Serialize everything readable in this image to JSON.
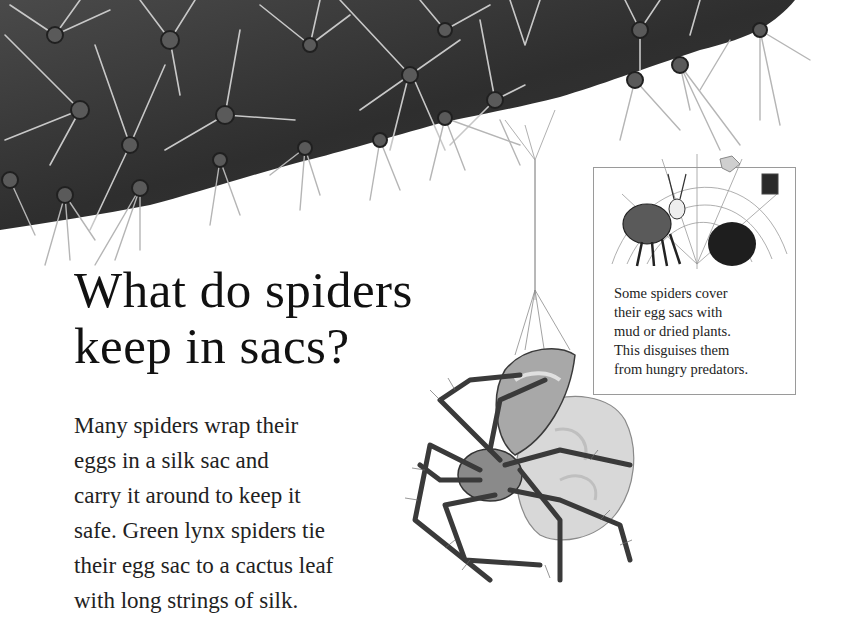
{
  "page": {
    "heading": {
      "lines": [
        "What do spiders",
        "keep in sacs?"
      ]
    },
    "body": {
      "lines": [
        "Many spiders wrap their",
        "eggs in a silk sac and",
        "carry it around to keep it",
        "safe. Green lynx spiders tie",
        "their egg sac to a cactus leaf",
        "with long strings of silk."
      ]
    },
    "infobox": {
      "illustration": "cartoon-spider-covering-egg-sac-with-mud",
      "caption_lines": [
        "Some spiders cover",
        "their egg sacs with",
        "mud or dried plants.",
        "This disguises them",
        "from hungry predators."
      ]
    },
    "illustrations": {
      "cactus": "cactus-leaf-with-spines",
      "spider": "green-lynx-spider-with-egg-sac"
    },
    "colors": {
      "background": "#ffffff",
      "cactus": "#3a3a3a",
      "text": "#1a1a1a",
      "box_border": "#9a9a9a"
    }
  }
}
